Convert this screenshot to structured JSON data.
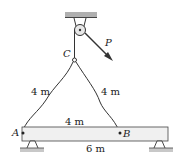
{
  "diagram": {
    "points": {
      "A": "A",
      "B": "B",
      "C": "C"
    },
    "force": "P",
    "lengths": {
      "cable_AC": "4 m",
      "cable_BC": "4 m",
      "AB": "4 m",
      "beam": "6 m"
    },
    "colors": {
      "line": "#333333",
      "ceiling": "#b0b0b0",
      "beam_fill": "#f0f0f0",
      "ground": "#c8c8c8"
    }
  }
}
